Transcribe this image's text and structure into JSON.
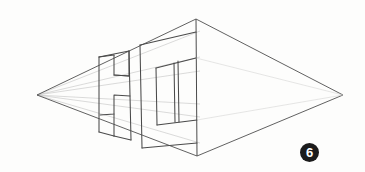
{
  "page": {
    "kind": "scanned-pencil-drawing",
    "width": 365,
    "height": 172,
    "background_color": "#fdfdfc",
    "ink_color": "#5a5a5a",
    "construction_line_color": "#b9b9b9"
  },
  "figure": {
    "label": "6",
    "label_shape": "filled-circle",
    "label_text_color": "#ffffff",
    "label_bg_color": "#1b1b1b"
  },
  "drawing": {
    "title": "Two-point perspective block letters",
    "vanishing_points": [
      {
        "name": "left-vanishing-point",
        "x": 37,
        "y": 95
      },
      {
        "name": "right-vanishing-point",
        "x": 343,
        "y": 95
      }
    ],
    "horizon_line": {
      "x1": 37,
      "y1": 95,
      "x2": 343,
      "y2": 95
    },
    "corner_vertices": {
      "top": {
        "x": 196,
        "y": 19
      },
      "bottom": {
        "x": 197,
        "y": 156
      }
    },
    "vertical_corner_edge": {
      "x1": 196,
      "y1": 19,
      "x2": 197,
      "y2": 156
    },
    "envelope_edges": [
      {
        "name": "upper-left-envelope",
        "x1": 37,
        "y1": 95,
        "x2": 196,
        "y2": 19
      },
      {
        "name": "upper-right-envelope",
        "x1": 196,
        "y1": 19,
        "x2": 343,
        "y2": 95
      },
      {
        "name": "lower-right-envelope",
        "x1": 343,
        "y1": 95,
        "x2": 197,
        "y2": 156
      },
      {
        "name": "lower-left-envelope",
        "x1": 197,
        "y1": 156,
        "x2": 37,
        "y2": 95
      }
    ],
    "construction_rays": [
      {
        "name": "ray-to-letter-top",
        "x1": 37,
        "y1": 95,
        "x2": 196,
        "y2": 32
      },
      {
        "name": "ray-to-letter-upper-bar",
        "x1": 37,
        "y1": 95,
        "x2": 196,
        "y2": 58
      },
      {
        "name": "ray-to-letter-lower-bar",
        "x1": 37,
        "y1": 95,
        "x2": 196,
        "y2": 72
      },
      {
        "name": "ray-to-letter-lower-inner",
        "x1": 37,
        "y1": 95,
        "x2": 196,
        "y2": 117
      },
      {
        "name": "ray-to-letter-base",
        "x1": 37,
        "y1": 95,
        "x2": 197,
        "y2": 143
      }
    ],
    "letters": [
      {
        "name": "letter-h-block",
        "glyph": "H",
        "description": "block letter H in perspective, nearest left"
      },
      {
        "name": "letter-t-block",
        "glyph": "T",
        "description": "block letter T in perspective, nearest the corner edge"
      }
    ]
  }
}
